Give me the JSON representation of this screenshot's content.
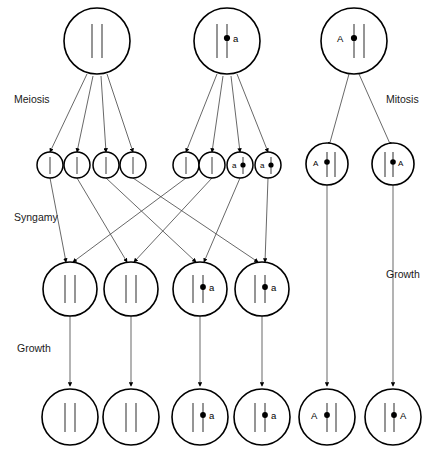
{
  "diagram": {
    "colors": {
      "background": "#ffffff",
      "outline": "#000000",
      "chromosome": "#555555",
      "connector": "#4d4d4d",
      "text": "#1a1a1a"
    },
    "stage_labels": {
      "meiosis": "Meiosis",
      "syngamy": "Syngamy",
      "growth_left": "Growth",
      "mitosis": "Mitosis",
      "growth_right": "Growth"
    },
    "rows": {
      "parent_cells": {
        "row_name": "parent-cells",
        "cells": [
          {
            "id": "parent-1",
            "chromosomes": 2,
            "centromere": false,
            "allele": "",
            "allele_side": "",
            "process": "meiosis"
          },
          {
            "id": "parent-2",
            "chromosomes": 2,
            "centromere": true,
            "allele": "a",
            "allele_side": "right",
            "process": "meiosis"
          },
          {
            "id": "parent-3",
            "chromosomes": 2,
            "centromere": true,
            "allele": "A",
            "allele_side": "left",
            "process": "mitosis"
          }
        ]
      },
      "gametes": {
        "row_name": "gametes",
        "cells": [
          {
            "id": "gamete-1",
            "chromosomes": 1,
            "centromere": false,
            "allele": "",
            "allele_side": ""
          },
          {
            "id": "gamete-2",
            "chromosomes": 1,
            "centromere": false,
            "allele": "",
            "allele_side": ""
          },
          {
            "id": "gamete-3",
            "chromosomes": 1,
            "centromere": false,
            "allele": "",
            "allele_side": ""
          },
          {
            "id": "gamete-4",
            "chromosomes": 1,
            "centromere": false,
            "allele": "",
            "allele_side": ""
          },
          {
            "id": "gamete-5",
            "chromosomes": 1,
            "centromere": false,
            "allele": "",
            "allele_side": ""
          },
          {
            "id": "gamete-6",
            "chromosomes": 1,
            "centromere": false,
            "allele": "",
            "allele_side": ""
          },
          {
            "id": "gamete-7",
            "chromosomes": 1,
            "centromere": true,
            "allele": "a",
            "allele_side": "left"
          },
          {
            "id": "gamete-8",
            "chromosomes": 1,
            "centromere": true,
            "allele": "a",
            "allele_side": "left"
          }
        ]
      },
      "mitosis_daughters": {
        "row_name": "mitosis-daughter-cells",
        "cells": [
          {
            "id": "mitosis-daughter-1",
            "chromosomes": 2,
            "centromere": true,
            "allele": "A",
            "allele_side": "left"
          },
          {
            "id": "mitosis-daughter-2",
            "chromosomes": 2,
            "centromere": true,
            "allele": "A",
            "allele_side": "right"
          }
        ]
      },
      "zygotes": {
        "row_name": "zygotes",
        "cells": [
          {
            "id": "zygote-1",
            "chromosomes": 2,
            "centromere": false,
            "allele": "",
            "allele_side": ""
          },
          {
            "id": "zygote-2",
            "chromosomes": 2,
            "centromere": false,
            "allele": "",
            "allele_side": ""
          },
          {
            "id": "zygote-3",
            "chromosomes": 2,
            "centromere": true,
            "allele": "a",
            "allele_side": "right"
          },
          {
            "id": "zygote-4",
            "chromosomes": 2,
            "centromere": true,
            "allele": "a",
            "allele_side": "right"
          }
        ]
      },
      "adults": {
        "row_name": "adult-cells",
        "cells": [
          {
            "id": "adult-1",
            "chromosomes": 2,
            "centromere": false,
            "allele": "",
            "allele_side": ""
          },
          {
            "id": "adult-2",
            "chromosomes": 2,
            "centromere": false,
            "allele": "",
            "allele_side": ""
          },
          {
            "id": "adult-3",
            "chromosomes": 2,
            "centromere": true,
            "allele": "a",
            "allele_side": "right"
          },
          {
            "id": "adult-4",
            "chromosomes": 2,
            "centromere": true,
            "allele": "a",
            "allele_side": "right"
          },
          {
            "id": "adult-5",
            "chromosomes": 2,
            "centromere": true,
            "allele": "A",
            "allele_side": "left"
          },
          {
            "id": "adult-6",
            "chromosomes": 2,
            "centromere": true,
            "allele": "A",
            "allele_side": "right"
          }
        ]
      }
    }
  }
}
